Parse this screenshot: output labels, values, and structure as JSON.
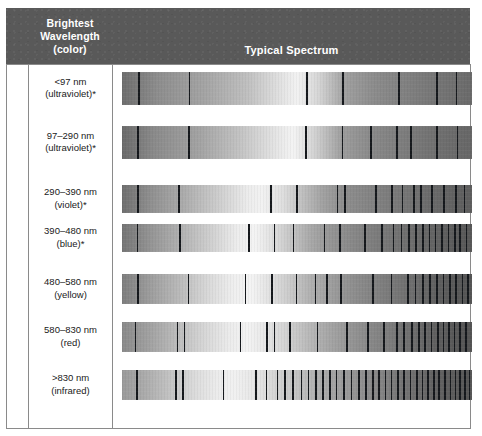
{
  "figure": {
    "title": "Typical Spectrum",
    "header": {
      "left_lines": [
        "Brightest",
        "Wavelength",
        "(color)"
      ],
      "right_label": "Typical Spectrum"
    },
    "colors": {
      "header_background": "#595959",
      "header_text": "#ffffff",
      "rule": "#8a8a8a",
      "absorption_line": "#15181c",
      "body_text": "#1a1a1a",
      "page_background": "#ffffff"
    },
    "columns": [
      "Brightest Wavelength (color)",
      "Typical Spectrum"
    ],
    "rows": [
      {
        "id": "row-lt97",
        "range": "<97 nm",
        "color": "(ultraviolet)*",
        "top": 72,
        "height": 33,
        "gradient": "linear-gradient(90deg, #6e6e6e 0%, #8d8d8d 10%, #a5a5a5 24%, #c0c0c0 36%, #e4e4e4 46%, #f2f2f2 50%, #d6d6d6 56%, #9f9f9f 64%, #8c8c8c 72%, #828282 80%, #787878 88%, #6f6f6f 96%, #6a6a6a 100%)",
        "lines": [
          {
            "x": 4.6,
            "w": 1.6
          },
          {
            "x": 19.0,
            "w": 1.6
          },
          {
            "x": 52.6,
            "w": 1.6
          },
          {
            "x": 62.9,
            "w": 1.7
          },
          {
            "x": 78.9,
            "w": 1.7
          },
          {
            "x": 89.7,
            "w": 1.7
          },
          {
            "x": 95.4,
            "w": 1.6
          }
        ]
      },
      {
        "id": "row-97-290",
        "range": "97–290 nm",
        "color": "(ultraviolet)*",
        "top": 126,
        "height": 33,
        "gradient": "linear-gradient(90deg, #6b6b6b 0%, #8a8a8a 9%, #a3a3a3 22%, #c4c4c4 34%, #e8e8e8 45%, #f4f4f4 49%, #d2d2d2 55%, #9d9d9d 63%, #8a8a8a 71%, #7f7f7f 79%, #747474 87%, #6b6b6b 95%, #676767 100%)",
        "lines": [
          {
            "x": 4.3,
            "w": 1.7
          },
          {
            "x": 18.9,
            "w": 1.6
          },
          {
            "x": 52.3,
            "w": 1.9
          },
          {
            "x": 62.8,
            "w": 1.6
          },
          {
            "x": 70.9,
            "w": 1.7
          },
          {
            "x": 78.4,
            "w": 1.8
          },
          {
            "x": 82.4,
            "w": 1.6
          },
          {
            "x": 89.8,
            "w": 1.8
          },
          {
            "x": 95.6,
            "w": 1.7
          }
        ]
      },
      {
        "id": "row-290-390",
        "range": "290–390 nm",
        "color": "(violet)*",
        "top": 185,
        "height": 28,
        "gradient": "linear-gradient(90deg, #6f6f6f 0%, #8f8f8f 8%, #adadad 18%, #cfcfcf 28%, #ececec 36%, #f2f2f2 40%, #dedede 46%, #c2c2c2 51%, #a3a3a3 57%, #8f8f8f 63%, #858585 70%, #7a7a7a 78%, #6e6e6e 86%, #636363 94%, #5e5e5e 100%)",
        "lines": [
          {
            "x": 4.4,
            "w": 1.8
          },
          {
            "x": 16.0,
            "w": 1.8
          },
          {
            "x": 42.4,
            "w": 1.6
          },
          {
            "x": 49.8,
            "w": 1.5
          },
          {
            "x": 61.3,
            "w": 1.8
          },
          {
            "x": 63.4,
            "w": 1.8
          },
          {
            "x": 72.3,
            "w": 1.6
          },
          {
            "x": 76.9,
            "w": 1.8
          },
          {
            "x": 79.9,
            "w": 1.7
          },
          {
            "x": 83.2,
            "w": 1.5
          },
          {
            "x": 85.2,
            "w": 1.7
          },
          {
            "x": 88.4,
            "w": 1.8
          },
          {
            "x": 91.8,
            "w": 1.6
          },
          {
            "x": 95.2,
            "w": 1.9
          },
          {
            "x": 97.6,
            "w": 1.6
          }
        ]
      },
      {
        "id": "row-390-480",
        "range": "390–480 nm",
        "color": "(blue)*",
        "top": 224,
        "height": 28,
        "gradient": "linear-gradient(90deg, #757575 0%, #949494 8%, #b2b2b2 17%, #d2d2d2 26%, #ededed 33%, #f4f4f4 38%, #e0e0e0 43%, #c6c6c6 48%, #a8a8a8 54%, #949494 60%, #868686 67%, #787878 75%, #6c6c6c 84%, #5f5f5f 92%, #585858 100%)",
        "lines": [
          {
            "x": 4.2,
            "w": 1.8
          },
          {
            "x": 16.3,
            "w": 1.8
          },
          {
            "x": 36.0,
            "w": 1.6
          },
          {
            "x": 43.3,
            "w": 1.5
          },
          {
            "x": 48.8,
            "w": 1.6
          },
          {
            "x": 57.6,
            "w": 1.8
          },
          {
            "x": 62.1,
            "w": 1.9
          },
          {
            "x": 69.1,
            "w": 1.8
          },
          {
            "x": 74.0,
            "w": 1.7
          },
          {
            "x": 77.4,
            "w": 1.6
          },
          {
            "x": 79.6,
            "w": 1.6
          },
          {
            "x": 81.8,
            "w": 1.8
          },
          {
            "x": 83.8,
            "w": 1.7
          },
          {
            "x": 85.8,
            "w": 1.6
          },
          {
            "x": 87.6,
            "w": 1.8
          },
          {
            "x": 89.4,
            "w": 1.6
          },
          {
            "x": 91.2,
            "w": 1.8
          },
          {
            "x": 93.0,
            "w": 1.7
          },
          {
            "x": 94.8,
            "w": 1.8
          },
          {
            "x": 96.4,
            "w": 1.7
          },
          {
            "x": 98.2,
            "w": 1.8
          }
        ]
      },
      {
        "id": "row-480-580",
        "range": "480–580 nm",
        "color": "(yellow)",
        "top": 274,
        "height": 30,
        "gradient": "linear-gradient(90deg, #7e7e7e 0%, #9d9d9d 8%, #bcbcbc 17%, #dadada 25%, #efefef 32%, #f4f4f4 37%, #e2e2e2 42%, #cacaca 48%, #b0b0b0 54%, #9a9a9a 61%, #8a8a8a 68%, #7b7b7b 76%, #6c6c6c 84%, #5d5d5d 92%, #555555 100%)",
        "lines": [
          {
            "x": 4.4,
            "w": 1.8
          },
          {
            "x": 18.8,
            "w": 1.7
          },
          {
            "x": 35.0,
            "w": 1.6
          },
          {
            "x": 42.6,
            "w": 1.6
          },
          {
            "x": 49.6,
            "w": 1.5
          },
          {
            "x": 55.0,
            "w": 1.6
          },
          {
            "x": 58.4,
            "w": 1.7
          },
          {
            "x": 62.4,
            "w": 1.8
          },
          {
            "x": 71.4,
            "w": 1.8
          },
          {
            "x": 76.8,
            "w": 1.7
          },
          {
            "x": 81.4,
            "w": 1.8
          },
          {
            "x": 83.6,
            "w": 1.7
          },
          {
            "x": 85.8,
            "w": 1.8
          },
          {
            "x": 87.8,
            "w": 1.7
          },
          {
            "x": 89.8,
            "w": 1.8
          },
          {
            "x": 91.6,
            "w": 1.7
          },
          {
            "x": 93.4,
            "w": 1.8
          },
          {
            "x": 95.2,
            "w": 1.7
          },
          {
            "x": 97.0,
            "w": 1.8
          },
          {
            "x": 98.6,
            "w": 1.7
          }
        ]
      },
      {
        "id": "row-580-830",
        "range": "580–830 nm",
        "color": "(red)",
        "top": 322,
        "height": 30,
        "gradient": "linear-gradient(90deg, #8a8a8a 0%, #a2a2a2 8%, #bdbdbd 16%, #d8d8d8 24%, #ececec 31%, #f3f3f3 36%, #e6e6e6 41%, #d2d2d2 47%, #bababa 53%, #a3a3a3 60%, #919191 67%, #808080 75%, #6e6e6e 83%, #5e5e5e 91%, #545454 100%)",
        "lines": [
          {
            "x": 3.6,
            "w": 1.8
          },
          {
            "x": 15.6,
            "w": 1.7
          },
          {
            "x": 17.6,
            "w": 1.8
          },
          {
            "x": 33.6,
            "w": 1.7
          },
          {
            "x": 41.2,
            "w": 1.6
          },
          {
            "x": 43.4,
            "w": 1.6
          },
          {
            "x": 47.8,
            "w": 1.6
          },
          {
            "x": 55.6,
            "w": 1.7
          },
          {
            "x": 64.0,
            "w": 1.6
          },
          {
            "x": 70.0,
            "w": 1.7
          },
          {
            "x": 74.6,
            "w": 1.7
          },
          {
            "x": 78.4,
            "w": 1.8
          },
          {
            "x": 80.4,
            "w": 1.7
          },
          {
            "x": 82.6,
            "w": 1.8
          },
          {
            "x": 84.6,
            "w": 1.6
          },
          {
            "x": 86.4,
            "w": 1.8
          },
          {
            "x": 88.2,
            "w": 1.7
          },
          {
            "x": 90.0,
            "w": 1.8
          },
          {
            "x": 91.6,
            "w": 1.7
          },
          {
            "x": 93.2,
            "w": 1.9
          },
          {
            "x": 94.8,
            "w": 1.7
          },
          {
            "x": 96.4,
            "w": 1.8
          },
          {
            "x": 98.0,
            "w": 1.8
          }
        ]
      },
      {
        "id": "row-gt830",
        "range": ">830 nm",
        "color": "(infrared)",
        "top": 370,
        "height": 30,
        "gradient": "linear-gradient(90deg, #9a9a9a 0%, #adadad 7%, #c4c4c4 14%, #dcdcdc 21%, #ebebeb 27%, #f1f1f1 32%, #e6e6e6 38%, #d4d4d4 44%, #bfbfbf 51%, #a9a9a9 58%, #969696 66%, #848484 74%, #727272 82%, #626262 90%, #565656 100%)",
        "lines": [
          {
            "x": 4.0,
            "w": 1.8
          },
          {
            "x": 15.2,
            "w": 1.7
          },
          {
            "x": 17.2,
            "w": 1.8
          },
          {
            "x": 28.8,
            "w": 1.6
          },
          {
            "x": 38.0,
            "w": 1.8
          },
          {
            "x": 41.0,
            "w": 1.6
          },
          {
            "x": 44.2,
            "w": 1.8
          },
          {
            "x": 46.4,
            "w": 1.7
          },
          {
            "x": 48.6,
            "w": 1.6
          },
          {
            "x": 51.0,
            "w": 1.8
          },
          {
            "x": 53.0,
            "w": 1.7
          },
          {
            "x": 55.2,
            "w": 1.8
          },
          {
            "x": 57.2,
            "w": 1.6
          },
          {
            "x": 59.2,
            "w": 1.8
          },
          {
            "x": 61.0,
            "w": 1.7
          },
          {
            "x": 63.2,
            "w": 1.8
          },
          {
            "x": 65.4,
            "w": 1.6
          },
          {
            "x": 67.4,
            "w": 1.8
          },
          {
            "x": 69.4,
            "w": 1.7
          },
          {
            "x": 71.4,
            "w": 1.8
          },
          {
            "x": 73.2,
            "w": 1.7
          },
          {
            "x": 75.0,
            "w": 1.8
          },
          {
            "x": 76.8,
            "w": 1.7
          },
          {
            "x": 78.6,
            "w": 1.8
          },
          {
            "x": 80.4,
            "w": 1.7
          },
          {
            "x": 82.2,
            "w": 1.8
          },
          {
            "x": 84.0,
            "w": 1.7
          },
          {
            "x": 85.6,
            "w": 1.8
          },
          {
            "x": 87.2,
            "w": 1.7
          },
          {
            "x": 88.8,
            "w": 1.8
          },
          {
            "x": 90.4,
            "w": 1.7
          },
          {
            "x": 92.0,
            "w": 1.8
          },
          {
            "x": 93.6,
            "w": 1.7
          },
          {
            "x": 95.0,
            "w": 1.8
          },
          {
            "x": 96.4,
            "w": 1.7
          },
          {
            "x": 97.8,
            "w": 1.8
          },
          {
            "x": 99.0,
            "w": 1.7
          }
        ]
      }
    ]
  },
  "chart_data": {
    "type": "table",
    "title": "Typical Spectrum",
    "columns": [
      "Brightest Wavelength (color)",
      "Typical Spectrum"
    ],
    "categories": [
      "<97 nm (ultraviolet)*",
      "97–290 nm (ultraviolet)*",
      "290–390 nm (violet)*",
      "390–480 nm (blue)*",
      "480–580 nm (yellow)",
      "580–830 nm (red)",
      ">830 nm (infrared)"
    ],
    "series": [
      {
        "name": "absorption line count",
        "values": [
          7,
          9,
          15,
          21,
          20,
          23,
          37
        ]
      },
      {
        "name": "peak brightness position (% across band)",
        "values": [
          50,
          49,
          40,
          38,
          37,
          36,
          32
        ]
      }
    ],
    "xlabel": "Wavelength across band (short → long)",
    "ylabel": "Brightest wavelength (color)",
    "grid": false,
    "legend": "none",
    "annotations": [
      "Each row shows a grayscale continuum spectrum overlaid with dark absorption lines.",
      "The brightness peak shifts toward the short-wavelength (left) end as the brightest wavelength increases.",
      "Absorption-line density increases markedly from ultraviolet rows to the infrared row.",
      "Asterisk (*) marks the ultraviolet, violet and blue categories."
    ]
  }
}
